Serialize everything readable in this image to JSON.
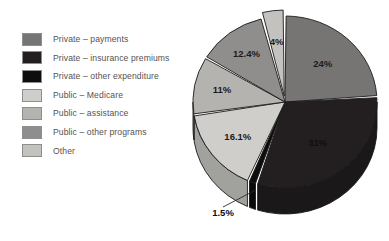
{
  "legend": {
    "items": [
      {
        "label": "Private  –  payments",
        "color": "#767574",
        "key": "private_payments"
      },
      {
        "label": "Private  –  insurance premiums",
        "color": "#231f20",
        "key": "private_insurance_premiums"
      },
      {
        "label": "Private  –  other expenditure",
        "color": "#0e0d0d",
        "key": "private_other_expenditure"
      },
      {
        "label": "Public  –  Medicare",
        "color": "#cfcecb",
        "key": "public_medicare"
      },
      {
        "label": "Public  –  assistance",
        "color": "#b4b3b0",
        "key": "public_assistance"
      },
      {
        "label": "Public  –  other programs",
        "color": "#8f8e8c",
        "key": "public_other_programs"
      },
      {
        "label": "Other",
        "color": "#c3c2bf",
        "key": "other"
      }
    ]
  },
  "chart_data": {
    "type": "pie",
    "title": "",
    "subtitle": "",
    "xlabel": "",
    "ylabel": "",
    "legend_position": "left",
    "grid": false,
    "units": "percent",
    "three_d": true,
    "start_angle_deg": 0,
    "direction": "clockwise",
    "total": 100,
    "categories": [
      "Private – payments",
      "Private – insurance premiums",
      "Private – other expenditure",
      "Public – Medicare",
      "Public – assistance",
      "Public – other programs",
      "Other"
    ],
    "values": [
      24,
      31,
      1.5,
      16.1,
      11,
      12.4,
      4
    ],
    "labels": [
      "24%",
      "31%",
      "1.5%",
      "16.1%",
      "11%",
      "12.4%",
      "4%"
    ],
    "colors": [
      "#767574",
      "#231f20",
      "#0e0d0d",
      "#cfcecb",
      "#b4b3b0",
      "#8f8e8c",
      "#c3c2bf"
    ],
    "exploded": [
      false,
      false,
      false,
      false,
      false,
      false,
      true
    ],
    "slices": [
      {
        "name": "Private – payments",
        "value": 24,
        "label": "24%",
        "color": "#767574"
      },
      {
        "name": "Private – insurance premiums",
        "value": 31,
        "label": "31%",
        "color": "#231f20"
      },
      {
        "name": "Private – other expenditure",
        "value": 1.5,
        "label": "1.5%",
        "color": "#0e0d0d"
      },
      {
        "name": "Public – Medicare",
        "value": 16.1,
        "label": "16.1%",
        "color": "#cfcecb"
      },
      {
        "name": "Public – assistance",
        "value": 11,
        "label": "11%",
        "color": "#b4b3b0"
      },
      {
        "name": "Public – other programs",
        "value": 12.4,
        "label": "12.4%",
        "color": "#8f8e8c"
      },
      {
        "name": "Other",
        "value": 4,
        "label": "4%",
        "color": "#c3c2bf"
      }
    ]
  }
}
